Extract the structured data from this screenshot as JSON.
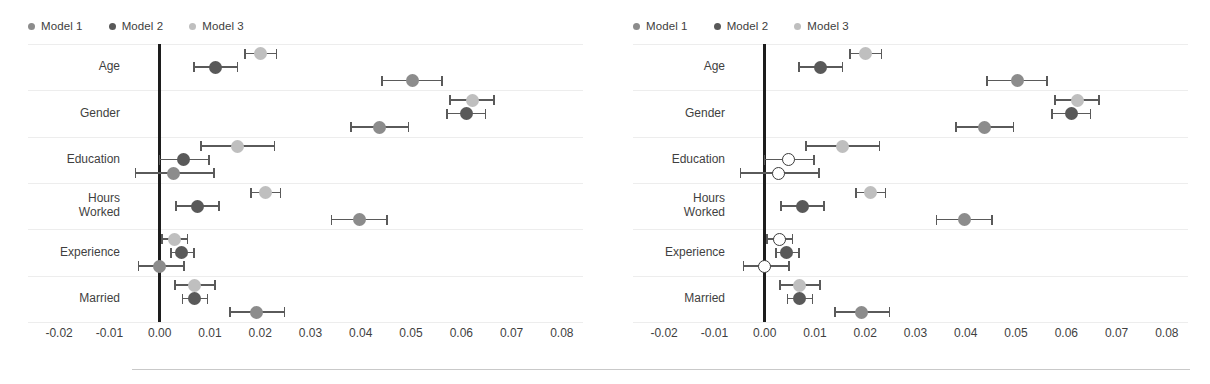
{
  "figure": {
    "footer_rule": true,
    "colors": {
      "model1": "#8c8c8c",
      "model2": "#595959",
      "model3": "#bfbfbf",
      "hollow_fill": "#ffffff",
      "hollow_stroke": "#3b3b3b",
      "error_bar": "#5a5a5a",
      "zero_line": "#1d1d1d",
      "gridline": "#ededed"
    }
  },
  "legend": {
    "position": "top-left",
    "items": [
      {
        "label": "Model 1",
        "color": "#8c8c8c"
      },
      {
        "label": "Model 2",
        "color": "#595959"
      },
      {
        "label": "Model 3",
        "color": "#bfbfbf"
      }
    ]
  },
  "axis": {
    "ticks": [
      "-0.02",
      "-0.01",
      "0.00",
      "0.01",
      "0.02",
      "0.03",
      "0.04",
      "0.05",
      "0.06",
      "0.07",
      "0.08"
    ],
    "tick_values": [
      -0.02,
      -0.01,
      0.0,
      0.01,
      0.02,
      0.03,
      0.04,
      0.05,
      0.06,
      0.07,
      0.08
    ],
    "xlim": [
      -0.025,
      0.085
    ],
    "zero_reference": 0.0
  },
  "categories": [
    "Age",
    "Gender",
    "Education",
    "Hours\nWorked",
    "Experience",
    "Married"
  ],
  "category_labels": [
    {
      "line1": "Age",
      "line2": ""
    },
    {
      "line1": "Gender",
      "line2": ""
    },
    {
      "line1": "Education",
      "line2": ""
    },
    {
      "line1": "Hours",
      "line2": "Worked"
    },
    {
      "line1": "Experience",
      "line2": ""
    },
    {
      "line1": "Married",
      "line2": ""
    }
  ],
  "chart_data": [
    {
      "type": "scatter",
      "panel": "left",
      "title": "",
      "xlabel": "",
      "ylabel": "",
      "xlim": [
        -0.025,
        0.085
      ],
      "grid": true,
      "legend_position": "top-left",
      "categories": [
        "Age",
        "Gender",
        "Education",
        "Hours Worked",
        "Experience",
        "Married"
      ],
      "series": [
        {
          "name": "Model 3",
          "color": "#bfbfbf",
          "points": [
            {
              "category": "Age",
              "estimate": 0.02,
              "ci_low": 0.017,
              "ci_high": 0.0232,
              "filled": true
            },
            {
              "category": "Gender",
              "estimate": 0.0622,
              "ci_low": 0.0578,
              "ci_high": 0.0665,
              "filled": true
            },
            {
              "category": "Education",
              "estimate": 0.0155,
              "ci_low": 0.0082,
              "ci_high": 0.0228,
              "filled": true
            },
            {
              "category": "Hours Worked",
              "estimate": 0.021,
              "ci_low": 0.0182,
              "ci_high": 0.024,
              "filled": true
            },
            {
              "category": "Experience",
              "estimate": 0.003,
              "ci_low": 0.0005,
              "ci_high": 0.0055,
              "filled": true
            },
            {
              "category": "Married",
              "estimate": 0.007,
              "ci_low": 0.003,
              "ci_high": 0.011,
              "filled": true
            }
          ]
        },
        {
          "name": "Model 2",
          "color": "#595959",
          "points": [
            {
              "category": "Age",
              "estimate": 0.0112,
              "ci_low": 0.0068,
              "ci_high": 0.0155,
              "filled": true
            },
            {
              "category": "Gender",
              "estimate": 0.061,
              "ci_low": 0.0572,
              "ci_high": 0.0648,
              "filled": true
            },
            {
              "category": "Education",
              "estimate": 0.0048,
              "ci_low": 0.0,
              "ci_high": 0.0098,
              "filled": true
            },
            {
              "category": "Hours Worked",
              "estimate": 0.0075,
              "ci_low": 0.0032,
              "ci_high": 0.0118,
              "filled": true
            },
            {
              "category": "Experience",
              "estimate": 0.0043,
              "ci_low": 0.0022,
              "ci_high": 0.0068,
              "filled": true
            },
            {
              "category": "Married",
              "estimate": 0.007,
              "ci_low": 0.0045,
              "ci_high": 0.0095,
              "filled": true
            }
          ]
        },
        {
          "name": "Model 1",
          "color": "#8c8c8c",
          "points": [
            {
              "category": "Age",
              "estimate": 0.0502,
              "ci_low": 0.0442,
              "ci_high": 0.0562,
              "filled": true
            },
            {
              "category": "Gender",
              "estimate": 0.0437,
              "ci_low": 0.038,
              "ci_high": 0.0495,
              "filled": true
            },
            {
              "category": "Education",
              "estimate": 0.0028,
              "ci_low": -0.0048,
              "ci_high": 0.0108,
              "filled": true
            },
            {
              "category": "Hours Worked",
              "estimate": 0.0398,
              "ci_low": 0.0342,
              "ci_high": 0.0452,
              "filled": true
            },
            {
              "category": "Experience",
              "estimate": 0.0,
              "ci_low": -0.0042,
              "ci_high": 0.0048,
              "filled": true
            },
            {
              "category": "Married",
              "estimate": 0.0192,
              "ci_low": 0.014,
              "ci_high": 0.0248,
              "filled": true
            }
          ]
        }
      ]
    },
    {
      "type": "scatter",
      "panel": "right",
      "title": "",
      "xlabel": "",
      "ylabel": "",
      "xlim": [
        -0.025,
        0.085
      ],
      "grid": true,
      "legend_position": "top-left",
      "categories": [
        "Age",
        "Gender",
        "Education",
        "Hours Worked",
        "Experience",
        "Married"
      ],
      "series": [
        {
          "name": "Model 3",
          "color": "#bfbfbf",
          "points": [
            {
              "category": "Age",
              "estimate": 0.02,
              "ci_low": 0.017,
              "ci_high": 0.0232,
              "filled": true
            },
            {
              "category": "Gender",
              "estimate": 0.0622,
              "ci_low": 0.0578,
              "ci_high": 0.0665,
              "filled": true
            },
            {
              "category": "Education",
              "estimate": 0.0155,
              "ci_low": 0.0082,
              "ci_high": 0.0228,
              "filled": true
            },
            {
              "category": "Hours Worked",
              "estimate": 0.021,
              "ci_low": 0.0182,
              "ci_high": 0.024,
              "filled": true
            },
            {
              "category": "Experience",
              "estimate": 0.003,
              "ci_low": 0.0005,
              "ci_high": 0.0055,
              "filled": false
            },
            {
              "category": "Married",
              "estimate": 0.007,
              "ci_low": 0.003,
              "ci_high": 0.011,
              "filled": true
            }
          ]
        },
        {
          "name": "Model 2",
          "color": "#595959",
          "points": [
            {
              "category": "Age",
              "estimate": 0.0112,
              "ci_low": 0.0068,
              "ci_high": 0.0155,
              "filled": true
            },
            {
              "category": "Gender",
              "estimate": 0.061,
              "ci_low": 0.0572,
              "ci_high": 0.0648,
              "filled": true
            },
            {
              "category": "Education",
              "estimate": 0.0048,
              "ci_low": 0.0,
              "ci_high": 0.0098,
              "filled": false
            },
            {
              "category": "Hours Worked",
              "estimate": 0.0075,
              "ci_low": 0.0032,
              "ci_high": 0.0118,
              "filled": true
            },
            {
              "category": "Experience",
              "estimate": 0.0043,
              "ci_low": 0.0022,
              "ci_high": 0.0068,
              "filled": true
            },
            {
              "category": "Married",
              "estimate": 0.007,
              "ci_low": 0.0045,
              "ci_high": 0.0095,
              "filled": true
            }
          ]
        },
        {
          "name": "Model 1",
          "color": "#8c8c8c",
          "points": [
            {
              "category": "Age",
              "estimate": 0.0502,
              "ci_low": 0.0442,
              "ci_high": 0.0562,
              "filled": true
            },
            {
              "category": "Gender",
              "estimate": 0.0437,
              "ci_low": 0.038,
              "ci_high": 0.0495,
              "filled": true
            },
            {
              "category": "Education",
              "estimate": 0.0028,
              "ci_low": -0.0048,
              "ci_high": 0.0108,
              "filled": false
            },
            {
              "category": "Hours Worked",
              "estimate": 0.0398,
              "ci_low": 0.0342,
              "ci_high": 0.0452,
              "filled": true
            },
            {
              "category": "Experience",
              "estimate": 0.0,
              "ci_low": -0.0042,
              "ci_high": 0.0048,
              "filled": false
            },
            {
              "category": "Married",
              "estimate": 0.0192,
              "ci_low": 0.014,
              "ci_high": 0.0248,
              "filled": true
            }
          ]
        }
      ]
    }
  ]
}
